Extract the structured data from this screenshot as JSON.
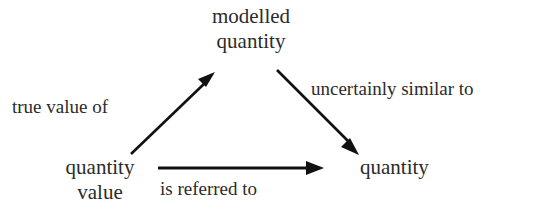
{
  "diagram": {
    "type": "concept-triangle",
    "background_color": "#ffffff",
    "ink_color": "#111111",
    "nodes": [
      {
        "id": "modelled-quantity",
        "lines": [
          "modelled",
          "quantity"
        ],
        "line1": "modelled",
        "line2": "quantity",
        "position": "top-center"
      },
      {
        "id": "quantity-value",
        "lines": [
          "quantity",
          "value"
        ],
        "line1": "quantity",
        "line2": "value",
        "position": "bottom-left"
      },
      {
        "id": "quantity",
        "lines": [
          "quantity"
        ],
        "line1": "quantity",
        "position": "bottom-right"
      }
    ],
    "edges": [
      {
        "id": "true-value-of",
        "label": "true value of",
        "from": "quantity-value",
        "to": "modelled-quantity",
        "direction": "up-right"
      },
      {
        "id": "uncertainly-similar-to",
        "label": "uncertainly similar to",
        "from": "modelled-quantity",
        "to": "quantity",
        "direction": "down-right"
      },
      {
        "id": "is-referred-to",
        "label": "is referred to",
        "from": "quantity-value",
        "to": "quantity",
        "direction": "right"
      }
    ]
  }
}
